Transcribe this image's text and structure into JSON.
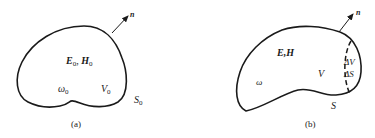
{
  "figure": {
    "panel_a": {
      "caption": "(a)",
      "field_label": {
        "main": "E",
        "sub": "0",
        "sep": ", ",
        "main2": "H",
        "sub2": "0"
      },
      "frequency_label": {
        "main": "ω",
        "sub": "0"
      },
      "volume_label": {
        "main": "V",
        "sub": "0"
      },
      "surface_label": {
        "main": "S",
        "sub": "0"
      },
      "normal_label": "n"
    },
    "panel_b": {
      "caption": "(b)",
      "field_label": "E,H",
      "frequency_label": "ω",
      "volume_label": "V",
      "delta_volume_label": "ΔV",
      "delta_surface_label": "ΔS",
      "surface_label": "S",
      "normal_label": "n"
    },
    "colors": {
      "stroke": "#1a1a1a",
      "background": "#ffffff"
    }
  }
}
